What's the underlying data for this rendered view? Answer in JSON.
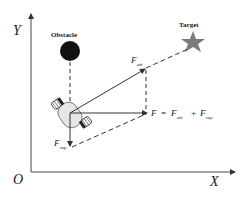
{
  "diagram": {
    "type": "artificial-potential-field",
    "axes": {
      "x_label": "X",
      "y_label": "Y",
      "origin_label": "O"
    },
    "objects": {
      "obstacle_label": "Obstacle",
      "target_label": "Target",
      "robot": "mobile-robot-icon"
    },
    "forces": {
      "attractive": {
        "symbol": "F",
        "subscript": "att"
      },
      "repulsive": {
        "symbol": "F",
        "subscript": "rep"
      },
      "resultant": {
        "lhs": "F",
        "eq": "=",
        "t1_symbol": "F",
        "t1_sub": "att",
        "plus": "+",
        "t2_symbol": "F",
        "t2_sub": "rep"
      }
    },
    "colors": {
      "line": "#333333",
      "obstacle": "#111111",
      "target": "#7a7a7a",
      "robot_body": "#e6e6e6",
      "robot_wheel": "#222222"
    }
  }
}
